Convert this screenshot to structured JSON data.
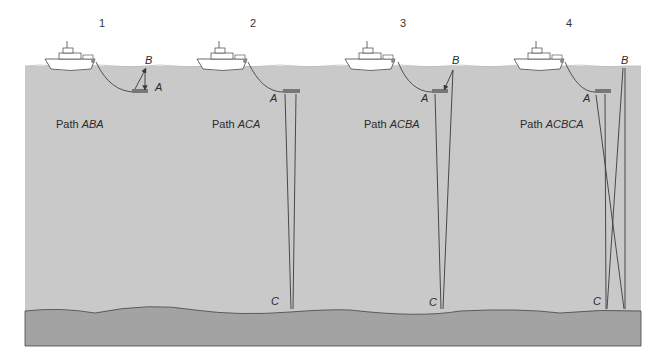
{
  "diagram": {
    "colors": {
      "water": "#c9c9c9",
      "seafloor": "#a3a3a3",
      "line": "#3a3a3a",
      "background": "#ffffff"
    },
    "panels": [
      {
        "number": "1",
        "path_prefix": "Path ",
        "path_name": "ABA",
        "labels": {
          "a": "A",
          "b": "B"
        }
      },
      {
        "number": "2",
        "path_prefix": "Path ",
        "path_name": "ACA",
        "labels": {
          "a": "A",
          "c": "C"
        }
      },
      {
        "number": "3",
        "path_prefix": "Path ",
        "path_name": "ACBA",
        "labels": {
          "a": "A",
          "b": "B",
          "c": "C"
        }
      },
      {
        "number": "4",
        "path_prefix": "Path ",
        "path_name": "ACBCA",
        "labels": {
          "a": "A",
          "b": "B",
          "c": "C"
        }
      }
    ]
  }
}
